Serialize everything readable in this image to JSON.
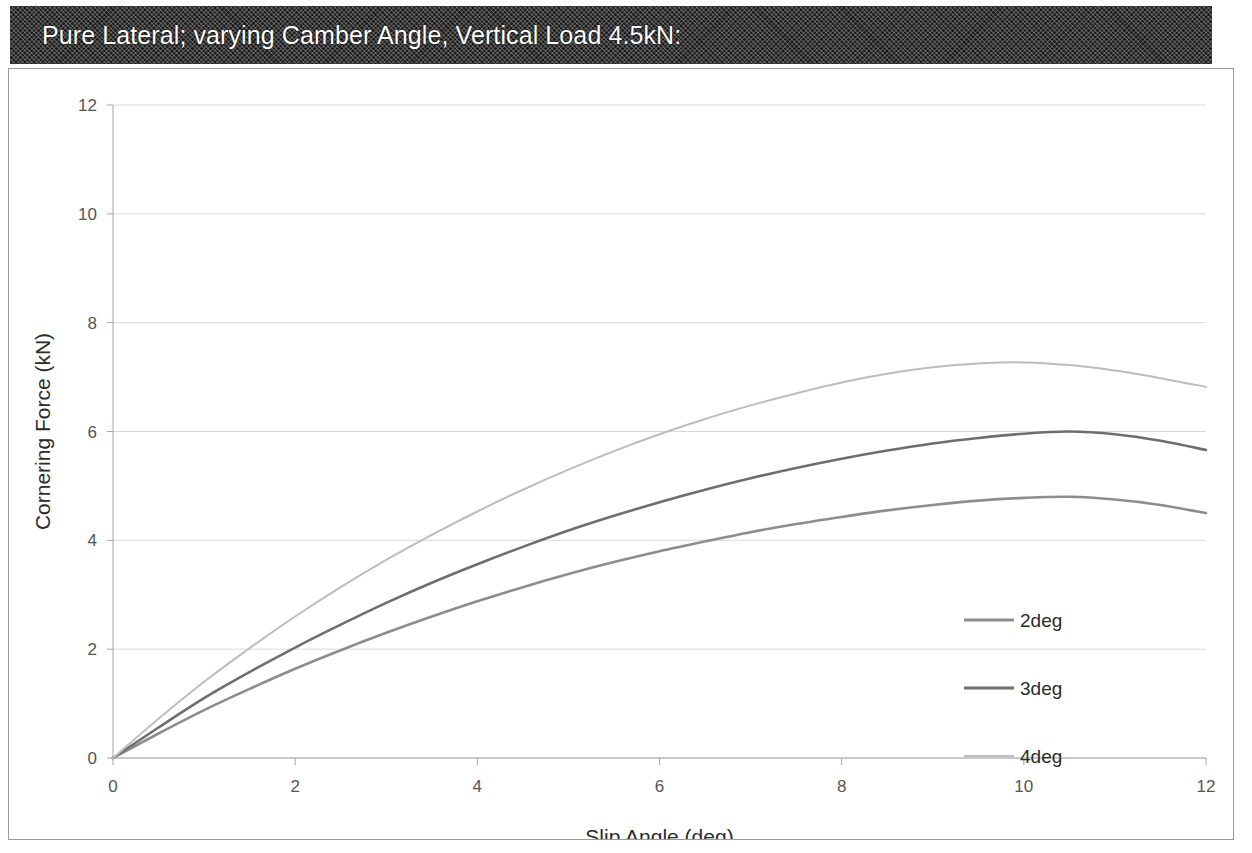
{
  "banner": {
    "title": "Pure Lateral; varying Camber Angle, Vertical Load 4.5kN:"
  },
  "chart_data": {
    "type": "line",
    "title": "Pure Lateral; varying Camber Angle, Vertical Load 4.5kN:",
    "xlabel": "Slip Angle (deg)",
    "ylabel": "Cornering Force (kN)",
    "xlim": [
      0,
      12
    ],
    "ylim": [
      0,
      12
    ],
    "xticks": [
      "0",
      "2",
      "4",
      "6",
      "8",
      "10",
      "12"
    ],
    "yticks": [
      "0",
      "2",
      "4",
      "6",
      "8",
      "10",
      "12"
    ],
    "xtick_values": [
      0,
      2,
      4,
      6,
      8,
      10,
      12
    ],
    "ytick_values": [
      0,
      2,
      4,
      6,
      8,
      10,
      12
    ],
    "grid": "horizontal",
    "legend_position": "inside-right",
    "x": [
      0,
      0.5,
      1,
      1.5,
      2,
      2.5,
      3,
      3.5,
      4,
      4.5,
      5,
      5.5,
      6,
      6.5,
      7,
      7.5,
      8,
      8.5,
      9,
      9.5,
      10,
      10.5,
      11,
      11.5,
      12
    ],
    "series": [
      {
        "name": "2deg",
        "color": "#8d8d8d",
        "values": [
          0.0,
          0.45,
          0.88,
          1.27,
          1.64,
          1.98,
          2.3,
          2.6,
          2.88,
          3.14,
          3.38,
          3.6,
          3.8,
          3.98,
          4.15,
          4.3,
          4.43,
          4.55,
          4.65,
          4.73,
          4.78,
          4.8,
          4.75,
          4.65,
          4.5
        ]
      },
      {
        "name": "3deg",
        "color": "#6e6e6e",
        "values": [
          0.0,
          0.56,
          1.1,
          1.58,
          2.03,
          2.45,
          2.85,
          3.22,
          3.56,
          3.88,
          4.18,
          4.45,
          4.7,
          4.93,
          5.14,
          5.33,
          5.5,
          5.65,
          5.78,
          5.88,
          5.96,
          6.0,
          5.95,
          5.83,
          5.66
        ]
      },
      {
        "name": "4deg",
        "color": "#bdbdbd",
        "values": [
          0.0,
          0.72,
          1.4,
          2.02,
          2.6,
          3.14,
          3.64,
          4.1,
          4.53,
          4.93,
          5.3,
          5.64,
          5.95,
          6.23,
          6.48,
          6.7,
          6.9,
          7.06,
          7.18,
          7.25,
          7.27,
          7.22,
          7.12,
          6.98,
          6.82
        ]
      }
    ]
  },
  "legend": {
    "items": [
      {
        "label": "2deg"
      },
      {
        "label": "3deg"
      },
      {
        "label": "4deg"
      }
    ]
  },
  "colors": {
    "banner_bg": "#1d1d1d",
    "banner_text": "#ffffff",
    "grid": "#d9d9d9",
    "axis": "#a6a6a6",
    "tick_text": "#555555"
  }
}
